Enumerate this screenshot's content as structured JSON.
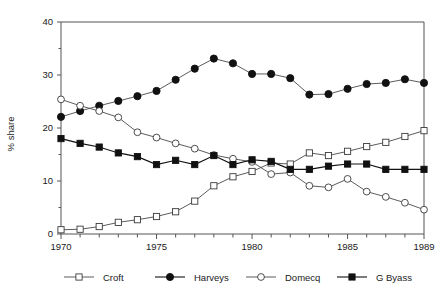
{
  "chart_data": {
    "type": "line",
    "title": "",
    "xlabel": "",
    "ylabel": "% share",
    "xlim": [
      1970,
      1989
    ],
    "ylim": [
      0,
      40
    ],
    "ytick_labels": [
      "0",
      "10",
      "20",
      "30",
      "40"
    ],
    "yticks": [
      0,
      10,
      20,
      30,
      40
    ],
    "xtick_labels": [
      "1970",
      "1975",
      "1980",
      "1985",
      "1989"
    ],
    "xticks": [
      1970,
      1975,
      1980,
      1985,
      1989
    ],
    "x": [
      1970,
      1971,
      1972,
      1973,
      1974,
      1975,
      1976,
      1977,
      1978,
      1979,
      1980,
      1981,
      1982,
      1983,
      1984,
      1985,
      1986,
      1987,
      1988,
      1989
    ],
    "grid": false,
    "legend_position": "bottom",
    "series": [
      {
        "name": "Croft",
        "marker": "open-square",
        "color": "#3a3a3a",
        "values": [
          0.8,
          0.9,
          1.4,
          2.2,
          2.7,
          3.3,
          4.2,
          6.2,
          9.1,
          10.8,
          11.8,
          13.4,
          13.2,
          15.3,
          14.8,
          15.6,
          16.5,
          17.3,
          18.4,
          19.5
        ]
      },
      {
        "name": "Harveys",
        "marker": "filled-circle",
        "color": "#111111",
        "values": [
          22.1,
          23.2,
          24.2,
          25.1,
          26.0,
          27.0,
          29.1,
          31.2,
          33.1,
          32.2,
          30.2,
          30.2,
          29.4,
          26.3,
          26.4,
          27.4,
          28.3,
          28.5,
          29.2,
          28.5
        ]
      },
      {
        "name": "Domecq",
        "marker": "open-circle",
        "color": "#3a3a3a",
        "values": [
          25.4,
          24.2,
          23.2,
          22.0,
          19.2,
          18.2,
          17.1,
          16.1,
          14.9,
          14.2,
          13.6,
          11.3,
          11.6,
          9.1,
          8.8,
          10.4,
          8.0,
          7.0,
          5.9,
          4.6
        ]
      },
      {
        "name": "G Byass",
        "marker": "filled-square",
        "color": "#111111",
        "values": [
          18.0,
          17.1,
          16.4,
          15.3,
          14.6,
          13.1,
          13.9,
          13.1,
          14.8,
          13.1,
          14.0,
          13.7,
          12.2,
          12.2,
          12.8,
          13.2,
          13.2,
          12.2,
          12.2,
          12.2
        ]
      }
    ]
  },
  "axis": {
    "ylabel": "% share"
  },
  "legend": {
    "items": [
      {
        "label": "Croft"
      },
      {
        "label": "Harveys"
      },
      {
        "label": "Domecq"
      },
      {
        "label": "G Byass"
      }
    ]
  }
}
